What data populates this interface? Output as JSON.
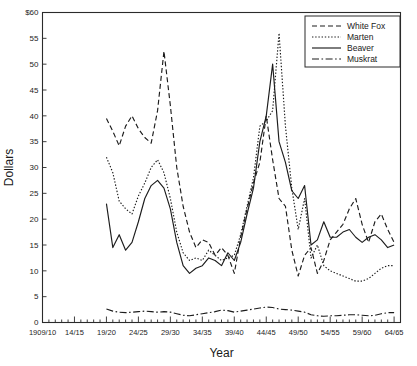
{
  "chart_data": {
    "type": "line",
    "title": "",
    "xlabel": "Year",
    "ylabel": "Dollars",
    "ylim": [
      0,
      60
    ],
    "ytick_step": 5,
    "ytick_labels": [
      "0",
      "5",
      "10",
      "15",
      "20",
      "25",
      "30",
      "35",
      "40",
      "45",
      "50",
      "55",
      "$60"
    ],
    "ytick_values": [
      0,
      5,
      10,
      15,
      20,
      25,
      30,
      35,
      40,
      45,
      50,
      55,
      60
    ],
    "xlim": [
      1909,
      1965
    ],
    "xtick_labels": [
      "1909/10",
      "14/15",
      "19/20",
      "24/25",
      "29/30",
      "34/35",
      "39/40",
      "44/45",
      "49/50",
      "54/55",
      "59/60",
      "64/65"
    ],
    "xtick_values": [
      1909,
      1914,
      1919,
      1924,
      1929,
      1934,
      1939,
      1944,
      1949,
      1954,
      1959,
      1964
    ],
    "minor_ticks": "every year",
    "grid": false,
    "legend_position": "top-right",
    "x": [
      1919,
      1920,
      1921,
      1922,
      1923,
      1924,
      1925,
      1926,
      1927,
      1928,
      1929,
      1930,
      1931,
      1932,
      1933,
      1934,
      1935,
      1936,
      1937,
      1938,
      1939,
      1940,
      1941,
      1942,
      1943,
      1944,
      1945,
      1946,
      1947,
      1948,
      1949,
      1950,
      1951,
      1952,
      1953,
      1954,
      1955,
      1956,
      1957,
      1958,
      1959,
      1960,
      1961,
      1962,
      1963,
      1964
    ],
    "series": [
      {
        "name": "White Fox",
        "style": "dashed",
        "values": [
          39.5,
          37.0,
          34.2,
          38.0,
          40.0,
          37.5,
          35.8,
          34.7,
          41.0,
          52.5,
          42.0,
          30.0,
          22.5,
          17.5,
          14.5,
          16.0,
          15.5,
          13.0,
          14.5,
          13.0,
          9.5,
          16.5,
          22.0,
          27.0,
          31.0,
          40.0,
          31.5,
          24.0,
          22.5,
          14.0,
          9.0,
          13.0,
          14.5,
          9.5,
          12.0,
          16.0,
          17.5,
          19.0,
          22.0,
          24.0,
          19.0,
          15.5,
          19.5,
          21.0,
          18.0,
          15.5
        ]
      },
      {
        "name": "Marten",
        "style": "dotted",
        "values": [
          32.0,
          29.0,
          23.5,
          22.0,
          21.0,
          24.5,
          27.0,
          30.0,
          31.5,
          29.0,
          24.0,
          17.5,
          13.5,
          12.0,
          12.5,
          12.0,
          14.0,
          13.0,
          12.0,
          12.5,
          13.0,
          17.0,
          22.5,
          28.0,
          38.0,
          39.0,
          41.0,
          56.0,
          38.0,
          26.0,
          18.0,
          24.0,
          12.5,
          15.0,
          11.0,
          10.0,
          9.5,
          9.0,
          8.5,
          8.0,
          8.0,
          8.5,
          9.5,
          10.5,
          11.0,
          11.0
        ]
      },
      {
        "name": "Beaver",
        "style": "solid",
        "values": [
          23.0,
          14.5,
          17.0,
          14.0,
          15.5,
          19.5,
          24.0,
          26.5,
          27.5,
          26.0,
          22.0,
          15.5,
          11.0,
          9.5,
          10.5,
          11.0,
          12.5,
          12.0,
          11.0,
          13.5,
          12.0,
          15.5,
          21.0,
          26.0,
          35.0,
          40.0,
          50.0,
          35.0,
          31.0,
          25.5,
          24.0,
          26.5,
          15.0,
          16.0,
          19.5,
          16.5,
          16.5,
          17.5,
          18.0,
          16.5,
          15.5,
          16.5,
          17.0,
          16.0,
          14.5,
          15.0
        ]
      },
      {
        "name": "Muskrat",
        "style": "dashdot",
        "values": [
          2.6,
          2.2,
          2.0,
          1.9,
          2.0,
          2.1,
          2.2,
          2.1,
          2.0,
          2.1,
          2.0,
          1.7,
          1.4,
          1.3,
          1.5,
          1.7,
          1.9,
          2.1,
          2.4,
          2.3,
          2.0,
          2.2,
          2.4,
          2.6,
          2.8,
          3.0,
          2.9,
          2.6,
          2.5,
          2.4,
          2.2,
          2.0,
          1.5,
          1.3,
          1.2,
          1.3,
          1.3,
          1.4,
          1.5,
          1.5,
          1.4,
          1.3,
          1.4,
          1.7,
          1.9,
          1.9
        ]
      }
    ]
  },
  "legend": {
    "items": [
      {
        "label": "White Fox"
      },
      {
        "label": "Marten"
      },
      {
        "label": "Beaver"
      },
      {
        "label": "Muskrat"
      }
    ]
  },
  "axes": {
    "y_title": "Dollars",
    "x_title": "Year"
  },
  "colors": {
    "line": "#1c1c1c",
    "axis": "#2b2b2b",
    "background": "#ffffff",
    "text": "#1a1a1a"
  }
}
